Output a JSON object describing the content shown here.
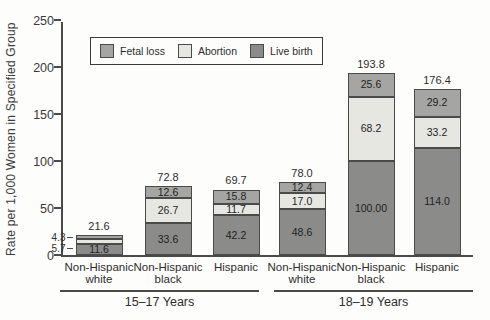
{
  "chart_data": {
    "type": "bar",
    "stacked": true,
    "title": "",
    "ylabel": "Rate per 1,000 Women in Specified Group",
    "xlabel": "",
    "ylim": [
      0,
      250
    ],
    "yticks": [
      "0",
      "50",
      "100",
      "150",
      "200",
      "250"
    ],
    "grid": false,
    "legend_position": "top-left-inside",
    "legend": [
      {
        "key": "fetal_loss",
        "label": "Fetal loss",
        "color": "#a5a5a3"
      },
      {
        "key": "abortion",
        "label": "Abortion",
        "color": "#e7e7e2"
      },
      {
        "key": "live_birth",
        "label": "Live birth",
        "color": "#8b8b89"
      }
    ],
    "stack_order_bottom_to_top": [
      "live_birth",
      "abortion",
      "fetal_loss"
    ],
    "groups": [
      {
        "label": "15–17 Years",
        "bars": [
          {
            "category_lines": [
              "Non-Hispanic",
              "white"
            ],
            "total_label": "21.6",
            "segments": [
              {
                "key": "live_birth",
                "value": 11.6,
                "label": "11.6",
                "label_position": "inside"
              },
              {
                "key": "abortion",
                "value": 5.7,
                "label": "5.7",
                "label_position": "outside-left"
              },
              {
                "key": "fetal_loss",
                "value": 4.3,
                "label": "4.3",
                "label_position": "outside-left"
              }
            ]
          },
          {
            "category_lines": [
              "Non-Hispanic",
              "black"
            ],
            "total_label": "72.8",
            "segments": [
              {
                "key": "live_birth",
                "value": 33.6,
                "label": "33.6",
                "label_position": "inside"
              },
              {
                "key": "abortion",
                "value": 26.7,
                "label": "26.7",
                "label_position": "inside"
              },
              {
                "key": "fetal_loss",
                "value": 12.6,
                "label": "12.6",
                "label_position": "inside"
              }
            ]
          },
          {
            "category_lines": [
              "Hispanic"
            ],
            "total_label": "69.7",
            "segments": [
              {
                "key": "live_birth",
                "value": 42.2,
                "label": "42.2",
                "label_position": "inside"
              },
              {
                "key": "abortion",
                "value": 11.7,
                "label": "11.7",
                "label_position": "inside"
              },
              {
                "key": "fetal_loss",
                "value": 15.8,
                "label": "15.8",
                "label_position": "inside"
              }
            ]
          }
        ]
      },
      {
        "label": "18–19 Years",
        "bars": [
          {
            "category_lines": [
              "Non-Hispanic",
              "white"
            ],
            "total_label": "78.0",
            "segments": [
              {
                "key": "live_birth",
                "value": 48.6,
                "label": "48.6",
                "label_position": "inside"
              },
              {
                "key": "abortion",
                "value": 17.0,
                "label": "17.0",
                "label_position": "inside"
              },
              {
                "key": "fetal_loss",
                "value": 12.4,
                "label": "12.4",
                "label_position": "inside"
              }
            ]
          },
          {
            "category_lines": [
              "Non-Hispanic",
              "black"
            ],
            "total_label": "193.8",
            "segments": [
              {
                "key": "live_birth",
                "value": 100.0,
                "label": "100.00",
                "label_position": "inside"
              },
              {
                "key": "abortion",
                "value": 68.2,
                "label": "68.2",
                "label_position": "inside"
              },
              {
                "key": "fetal_loss",
                "value": 25.6,
                "label": "25.6",
                "label_position": "inside"
              }
            ]
          },
          {
            "category_lines": [
              "Hispanic"
            ],
            "total_label": "176.4",
            "segments": [
              {
                "key": "live_birth",
                "value": 114.0,
                "label": "114.0",
                "label_position": "inside"
              },
              {
                "key": "abortion",
                "value": 33.2,
                "label": "33.2",
                "label_position": "inside"
              },
              {
                "key": "fetal_loss",
                "value": 29.2,
                "label": "29.2",
                "label_position": "inside"
              }
            ]
          }
        ]
      }
    ]
  }
}
